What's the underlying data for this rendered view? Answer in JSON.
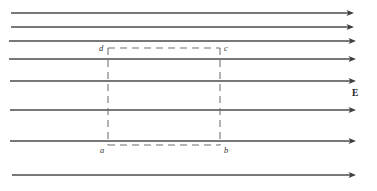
{
  "figure": {
    "canvas": {
      "width": 377,
      "height": 191,
      "background": "#ffffff"
    },
    "colors": {
      "field_line": "#4b4b4b",
      "arrow_head": "#3c3c3c",
      "dashed_path": "#6f6f6f",
      "label_text": "#2f2f2f",
      "field_label_text": "#1d1d1d"
    },
    "field_label": "E",
    "field_label_position": {
      "x": 352,
      "y": 96
    },
    "caption_partial": "",
    "field_lines": [
      {
        "name": "field-line-1",
        "y": 13,
        "x_start": 11,
        "x_end": 354,
        "has_arrow": true
      },
      {
        "name": "field-line-2",
        "y": 27,
        "x_start": 11,
        "x_end": 354,
        "has_arrow": true
      },
      {
        "name": "field-line-3",
        "y": 41,
        "x_start": 9,
        "x_end": 356,
        "has_arrow": true
      },
      {
        "name": "field-line-4",
        "y": 59,
        "x_start": 9,
        "x_end": 356,
        "has_arrow": true
      },
      {
        "name": "field-line-5",
        "y": 81,
        "x_start": 10,
        "x_end": 356,
        "has_arrow": true
      },
      {
        "name": "field-line-6",
        "y": 110,
        "x_start": 10,
        "x_end": 356,
        "has_arrow": true
      },
      {
        "name": "field-line-7",
        "y": 141,
        "x_start": 10,
        "x_end": 356,
        "has_arrow": true
      },
      {
        "name": "field-line-8",
        "y": 175,
        "x_start": 12,
        "x_end": 356,
        "has_arrow": true
      }
    ],
    "dashed_rectangle": {
      "left": 108,
      "right": 220,
      "top": 48,
      "bottom": 145
    },
    "vertices": [
      {
        "id": "a",
        "label": "a",
        "label_x": 100,
        "label_y": 153,
        "corner": "bottom-left"
      },
      {
        "id": "b",
        "label": "b",
        "label_x": 224,
        "label_y": 153,
        "corner": "bottom-right"
      },
      {
        "id": "c",
        "label": "c",
        "label_x": 224,
        "label_y": 51,
        "corner": "top-right"
      },
      {
        "id": "d",
        "label": "d",
        "label_x": 99,
        "label_y": 51,
        "corner": "top-left"
      }
    ]
  },
  "chart_data": {
    "type": "diagram",
    "field_direction": "rightward (+x)",
    "field_line_count": 8,
    "field_line_y_positions": [
      13,
      27,
      41,
      59,
      81,
      110,
      141,
      175
    ],
    "rectangle_vertices": {
      "a": [
        108,
        145
      ],
      "b": [
        220,
        145
      ],
      "c": [
        220,
        48
      ],
      "d": [
        108,
        48
      ]
    },
    "annotations": [
      "E",
      "a",
      "b",
      "c",
      "d"
    ],
    "xlabel": "",
    "ylabel": "",
    "grid": false,
    "legend": "none"
  }
}
